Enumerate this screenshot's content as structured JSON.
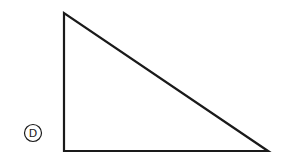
{
  "figure": {
    "option_label": "D",
    "shape": "right-triangle",
    "vertices": {
      "top": [
        64,
        13
      ],
      "bottom_left": [
        64,
        151
      ],
      "bottom_right": [
        268,
        151
      ]
    },
    "stroke_color": "#1a1a1a",
    "background_color": "#ffffff"
  }
}
